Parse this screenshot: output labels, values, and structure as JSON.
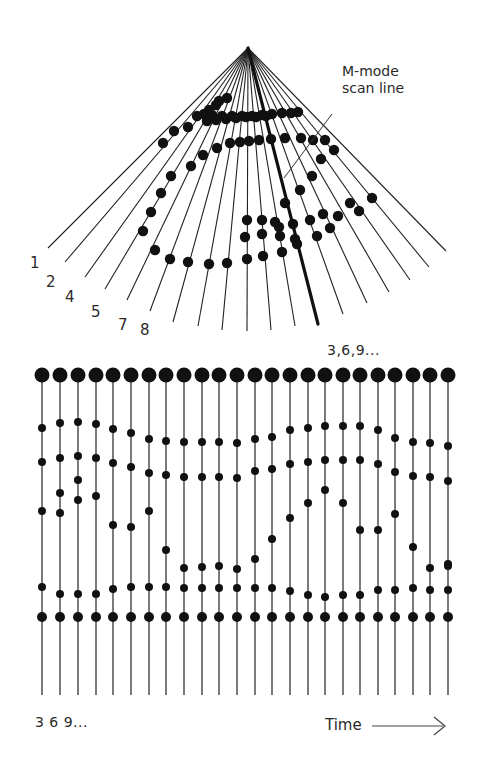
{
  "colors": {
    "ink": "#111111",
    "text": "#2a2a2a",
    "line": "#333333",
    "background": "#ffffff"
  },
  "sector": {
    "apex": [
      248,
      48
    ],
    "scan_line_ends": [
      [
        48,
        248
      ],
      [
        65,
        262
      ],
      [
        85,
        277
      ],
      [
        105,
        289
      ],
      [
        127,
        300
      ],
      [
        150,
        311
      ],
      [
        173,
        322
      ],
      [
        198,
        326
      ],
      [
        222,
        330
      ],
      [
        247,
        331
      ],
      [
        271,
        330
      ],
      [
        295,
        326
      ],
      [
        343,
        314
      ],
      [
        367,
        303
      ],
      [
        389,
        292
      ],
      [
        410,
        280
      ],
      [
        429,
        267
      ],
      [
        446,
        251
      ]
    ],
    "mmode_line_end": [
      318,
      324
    ],
    "line_labels": [
      {
        "text": "1",
        "x": 30,
        "y": 256
      },
      {
        "text": "2",
        "x": 46,
        "y": 275
      },
      {
        "text": "4",
        "x": 65,
        "y": 290
      },
      {
        "text": "5",
        "x": 91,
        "y": 305
      },
      {
        "text": "7",
        "x": 118,
        "y": 318
      },
      {
        "text": "8",
        "x": 140,
        "y": 323
      }
    ],
    "dots": [
      [
        219,
        101
      ],
      [
        227,
        98
      ],
      [
        209,
        110
      ],
      [
        216,
        105
      ],
      [
        204,
        114
      ],
      [
        212,
        115
      ],
      [
        222,
        116
      ],
      [
        232,
        116
      ],
      [
        242,
        116
      ],
      [
        252,
        116
      ],
      [
        262,
        115
      ],
      [
        272,
        114
      ],
      [
        282,
        113
      ],
      [
        291,
        113
      ],
      [
        298,
        112
      ],
      [
        207,
        121
      ],
      [
        216,
        120
      ],
      [
        226,
        119
      ],
      [
        236,
        118
      ],
      [
        246,
        117
      ],
      [
        256,
        117
      ],
      [
        266,
        116
      ],
      [
        197,
        116
      ],
      [
        174,
        131
      ],
      [
        188,
        127
      ],
      [
        163,
        143
      ],
      [
        217,
        148
      ],
      [
        230,
        143
      ],
      [
        240,
        142
      ],
      [
        249,
        141
      ],
      [
        259,
        140
      ],
      [
        271,
        139
      ],
      [
        285,
        138
      ],
      [
        301,
        138
      ],
      [
        313,
        140
      ],
      [
        325,
        140
      ],
      [
        203,
        155
      ],
      [
        191,
        166
      ],
      [
        171,
        176
      ],
      [
        161,
        193
      ],
      [
        151,
        212
      ],
      [
        143,
        231
      ],
      [
        334,
        150
      ],
      [
        321,
        159
      ],
      [
        312,
        176
      ],
      [
        300,
        190
      ],
      [
        285,
        203
      ],
      [
        275,
        222
      ],
      [
        247,
        220
      ],
      [
        262,
        220
      ],
      [
        279,
        227
      ],
      [
        293,
        224
      ],
      [
        310,
        220
      ],
      [
        323,
        214
      ],
      [
        338,
        216
      ],
      [
        350,
        203
      ],
      [
        359,
        211
      ],
      [
        372,
        198
      ],
      [
        245,
        237
      ],
      [
        262,
        234
      ],
      [
        280,
        236
      ],
      [
        295,
        239
      ],
      [
        317,
        236
      ],
      [
        330,
        228
      ],
      [
        155,
        250
      ],
      [
        170,
        259
      ],
      [
        188,
        262
      ],
      [
        209,
        264
      ],
      [
        227,
        263
      ],
      [
        247,
        259
      ],
      [
        263,
        256
      ],
      [
        282,
        252
      ],
      [
        297,
        244
      ]
    ]
  },
  "annotation": {
    "title_line1": "M-mode",
    "title_line2": "scan line",
    "pointer_from": [
      332,
      114
    ],
    "pointer_to": [
      284,
      178
    ]
  },
  "sequence_label_top": "3,6,9...",
  "mmode": {
    "line_x": [
      42,
      60,
      78,
      96,
      113,
      131,
      149,
      166,
      184,
      202,
      219,
      237,
      255,
      272,
      290,
      308,
      325,
      343,
      360,
      378,
      395,
      413,
      430,
      448
    ],
    "line_top": 375,
    "line_bottom": 695,
    "top_dot_y": 375,
    "top_dot_r": 7.5,
    "small_dot_r": 4,
    "rows": [
      [
        428,
        423,
        422,
        424,
        429,
        433,
        439,
        441,
        442,
        442,
        442,
        443,
        439,
        437,
        430,
        428,
        426,
        426,
        426,
        430,
        438,
        442,
        443,
        446
      ],
      [
        462,
        458,
        456,
        458,
        463,
        467,
        473,
        475,
        477,
        477,
        477,
        478,
        471,
        469,
        464,
        462,
        460,
        460,
        460,
        464,
        472,
        476,
        477,
        481
      ],
      [
        511,
        493,
        480,
        496,
        525,
        527,
        511,
        550,
        568,
        567,
        566,
        569,
        559,
        539,
        518,
        503,
        490,
        503,
        530,
        530,
        514,
        547,
        568,
        566
      ],
      [
        null,
        513,
        500,
        null,
        null,
        null,
        null,
        null,
        null,
        null,
        null,
        null,
        null,
        null,
        null,
        null,
        null,
        null,
        null,
        null,
        null,
        null,
        null,
        564
      ],
      [
        587,
        594,
        594,
        594,
        589,
        587,
        587,
        587,
        588,
        588,
        588,
        588,
        588,
        588,
        591,
        595,
        597,
        595,
        595,
        590,
        590,
        588,
        590,
        590
      ]
    ],
    "lower_dot_y": 617,
    "lower_dot_r": 5
  },
  "sequence_label_bottom": "3 6 9...",
  "time_axis": {
    "label": "Time",
    "arrow": "→"
  }
}
